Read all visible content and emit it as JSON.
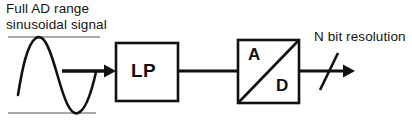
{
  "diagram": {
    "background_color": "#ffffff",
    "stroke_color": "#111111",
    "range_line_color": "#8c8c8c",
    "labels": {
      "input_caption_line1": "Full AD range",
      "input_caption_line2": "sinusoidal signal",
      "output_caption": "N bit resolution",
      "lowpass_block": "LP",
      "adc_analog": "A",
      "adc_digital": "D"
    },
    "blocks": [
      {
        "id": "lowpass",
        "name": "low-pass-filter-block",
        "label": "LP",
        "x": 115,
        "y": 42,
        "width": 63,
        "height": 59
      },
      {
        "id": "adc",
        "name": "analog-to-digital-converter-block",
        "label_top_left": "A",
        "label_bottom_right": "D",
        "x": 237,
        "y": 39,
        "width": 63,
        "height": 65
      }
    ],
    "signals": {
      "input_waveform": "sinusoid",
      "input_arrow": {
        "from_x": 62,
        "to_x": 115,
        "y": 71
      },
      "interconnect": {
        "from_x": 178,
        "to_x": 237,
        "y": 71
      },
      "output_arrow": {
        "from_x": 300,
        "to_x": 355,
        "y": 71
      },
      "bus_slash_label": "N"
    },
    "range_lines": {
      "upper_y": 37,
      "lower_y": 113,
      "from_x": 8,
      "to_x": 100
    }
  }
}
